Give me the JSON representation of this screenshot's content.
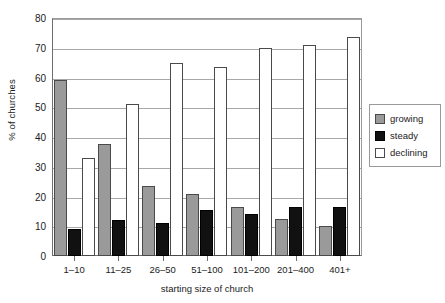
{
  "chart_data": {
    "type": "bar",
    "title": "",
    "xlabel": "starting size of church",
    "ylabel": "% of churches",
    "categories": [
      "1–10",
      "11–25",
      "26–50",
      "51–100",
      "101–200",
      "201–400",
      "401+"
    ],
    "series": [
      {
        "name": "growing",
        "color": "#9a9a9a",
        "values": [
          59,
          37.5,
          23.5,
          21,
          16.5,
          12.5,
          10
        ]
      },
      {
        "name": "steady",
        "color": "#111111",
        "values": [
          9,
          12,
          11,
          15.5,
          14,
          16.5,
          16.5
        ]
      },
      {
        "name": "declining",
        "color": "#ffffff",
        "values": [
          33,
          51,
          65,
          63.5,
          70,
          71,
          73.5
        ]
      }
    ],
    "ylim": [
      0,
      80
    ],
    "yticks": [
      0,
      10,
      20,
      30,
      40,
      50,
      60,
      70,
      80
    ],
    "ytick_labels": [
      "0",
      "10",
      "20",
      "30",
      "40",
      "50",
      "60",
      "70",
      "80"
    ],
    "grid": true,
    "legend_position": "right"
  },
  "legend": {
    "items": [
      {
        "label": "growing"
      },
      {
        "label": "steady"
      },
      {
        "label": "declining"
      }
    ]
  },
  "axes": {
    "x_title": "starting size of church",
    "y_title": "% of churches"
  }
}
